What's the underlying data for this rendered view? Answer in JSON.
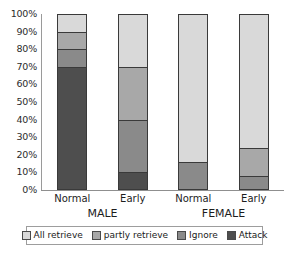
{
  "chart_data": {
    "type": "bar",
    "stacked": true,
    "stack_mode": "percent",
    "title": "",
    "subtitle": "",
    "xlabel": "",
    "ylabel": "",
    "ylim": [
      0,
      100
    ],
    "grid": false,
    "legend_position": "bottom",
    "categories": [
      "Normal",
      "Early",
      "Normal",
      "Early"
    ],
    "groups": [
      {
        "label": "MALE",
        "categories": [
          "Normal",
          "Early"
        ]
      },
      {
        "label": "FEMALE",
        "categories": [
          "Normal",
          "Early"
        ]
      }
    ],
    "y_ticks": [
      "0%",
      "10%",
      "20%",
      "30%",
      "40%",
      "50%",
      "60%",
      "70%",
      "80%",
      "90%",
      "100%"
    ],
    "y_tick_values": [
      0,
      10,
      20,
      30,
      40,
      50,
      60,
      70,
      80,
      90,
      100
    ],
    "series": [
      {
        "name": "All retrieve",
        "color": "#d9d9d9",
        "values": [
          10,
          30,
          84,
          76
        ]
      },
      {
        "name": "partly retrieve",
        "color": "#a8a8a8",
        "values": [
          10,
          30,
          0,
          16
        ]
      },
      {
        "name": "Ignore",
        "color": "#8a8a8a",
        "values": [
          10,
          30,
          16,
          8
        ]
      },
      {
        "name": "Attack",
        "color": "#4e4e4e",
        "values": [
          70,
          10,
          0,
          0
        ]
      }
    ],
    "bars": [
      {
        "group": "MALE",
        "category": "Normal",
        "segments_bottom_to_top": [
          {
            "name": "Attack",
            "value": 70,
            "range": [
              0,
              70
            ]
          },
          {
            "name": "Ignore",
            "value": 10,
            "range": [
              70,
              80
            ]
          },
          {
            "name": "partly retrieve",
            "value": 10,
            "range": [
              80,
              90
            ]
          },
          {
            "name": "All retrieve",
            "value": 10,
            "range": [
              90,
              100
            ]
          }
        ]
      },
      {
        "group": "MALE",
        "category": "Early",
        "segments_bottom_to_top": [
          {
            "name": "Attack",
            "value": 10,
            "range": [
              0,
              10
            ]
          },
          {
            "name": "Ignore",
            "value": 30,
            "range": [
              10,
              40
            ]
          },
          {
            "name": "partly retrieve",
            "value": 30,
            "range": [
              40,
              70
            ]
          },
          {
            "name": "All retrieve",
            "value": 30,
            "range": [
              70,
              100
            ]
          }
        ]
      },
      {
        "group": "FEMALE",
        "category": "Normal",
        "segments_bottom_to_top": [
          {
            "name": "Attack",
            "value": 0,
            "range": [
              0,
              0
            ]
          },
          {
            "name": "Ignore",
            "value": 16,
            "range": [
              0,
              16
            ]
          },
          {
            "name": "partly retrieve",
            "value": 0,
            "range": [
              16,
              16
            ]
          },
          {
            "name": "All retrieve",
            "value": 84,
            "range": [
              16,
              100
            ]
          }
        ]
      },
      {
        "group": "FEMALE",
        "category": "Early",
        "segments_bottom_to_top": [
          {
            "name": "Attack",
            "value": 0,
            "range": [
              0,
              0
            ]
          },
          {
            "name": "Ignore",
            "value": 8,
            "range": [
              0,
              8
            ]
          },
          {
            "name": "partly retrieve",
            "value": 16,
            "range": [
              8,
              24
            ]
          },
          {
            "name": "All retrieve",
            "value": 76,
            "range": [
              24,
              100
            ]
          }
        ]
      }
    ]
  },
  "legend": {
    "items": [
      {
        "label": "All retrieve",
        "color": "#d9d9d9"
      },
      {
        "label": "partly retrieve",
        "color": "#a8a8a8"
      },
      {
        "label": "Ignore",
        "color": "#8a8a8a"
      },
      {
        "label": "Attack",
        "color": "#4e4e4e"
      }
    ]
  },
  "axis": {
    "y_labels": [
      "100%",
      "90%",
      "80%",
      "70%",
      "60%",
      "50%",
      "40%",
      "30%",
      "20%",
      "10%",
      "0%"
    ]
  }
}
